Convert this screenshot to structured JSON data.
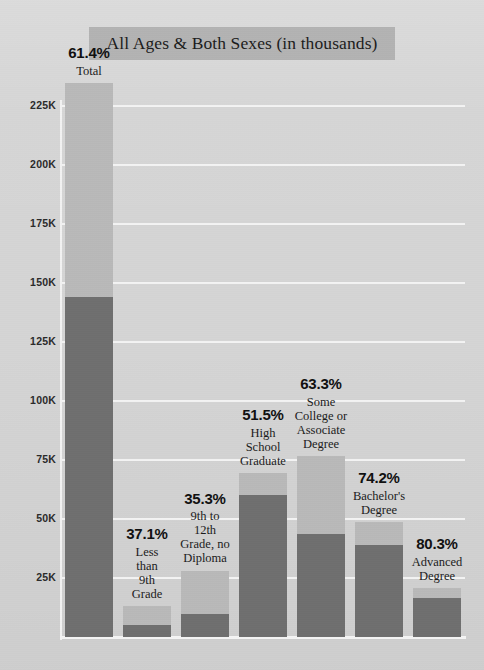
{
  "chart_data": {
    "type": "bar",
    "title": "All Ages & Both Sexes (in thousands)",
    "xlabel": "",
    "ylabel": "",
    "ylim": [
      0,
      237
    ],
    "y_unit": "thousands",
    "grid": true,
    "legend": "none",
    "stacked": true,
    "y_ticks": [
      {
        "value": 225,
        "label": "225K"
      },
      {
        "value": 200,
        "label": "200K"
      },
      {
        "value": 175,
        "label": "175K"
      },
      {
        "value": 150,
        "label": "150K"
      },
      {
        "value": 125,
        "label": "125K"
      },
      {
        "value": 100,
        "label": "100K"
      },
      {
        "value": 75,
        "label": "75K"
      },
      {
        "value": 50,
        "label": "50K"
      },
      {
        "value": 25,
        "label": "25K"
      }
    ],
    "categories": [
      "Total",
      "Less than 9th Grade",
      "9th to 12th Grade, no Diploma",
      "High School Graduate",
      "Some College or Associate Degree",
      "Bachelor's Degree",
      "Advanced Degree"
    ],
    "series": [
      {
        "name": "value",
        "values": [
          144.1,
          4.9,
          9.9,
          60.2,
          43.6,
          38.9,
          16.6
        ]
      },
      {
        "name": "total",
        "values": [
          234.7,
          13.2,
          28.1,
          69.3,
          76.5,
          48.8,
          20.6
        ]
      }
    ],
    "bars": [
      {
        "pct": "61.4%",
        "name": "Total",
        "name_lines": [
          "Total"
        ],
        "dark_value": 144.1,
        "total_value": 234.7
      },
      {
        "pct": "37.1%",
        "name": "Less than 9th Grade",
        "name_lines": [
          "Less",
          "than",
          "9th",
          "Grade"
        ],
        "dark_value": 4.9,
        "total_value": 13.2
      },
      {
        "pct": "35.3%",
        "name": "9th to 12th Grade, no Diploma",
        "name_lines": [
          "9th to",
          "12th",
          "Grade, no",
          "Diploma"
        ],
        "dark_value": 9.9,
        "total_value": 28.1
      },
      {
        "pct": "51.5%",
        "name": "High School Graduate",
        "name_lines": [
          "High",
          "School",
          "Graduate"
        ],
        "dark_value": 60.2,
        "total_value": 69.3
      },
      {
        "pct": "63.3%",
        "name": "Some College or Associate Degree",
        "name_lines": [
          "Some",
          "College or",
          "Associate",
          "Degree"
        ],
        "dark_value": 43.6,
        "total_value": 76.5
      },
      {
        "pct": "74.2%",
        "name": "Bachelor's Degree",
        "name_lines": [
          "Bachelor's",
          "Degree"
        ],
        "dark_value": 38.9,
        "total_value": 48.8
      },
      {
        "pct": "80.3%",
        "name": "Advanced Degree",
        "name_lines": [
          "Advanced",
          "Degree"
        ],
        "dark_value": 16.6,
        "total_value": 20.6
      }
    ],
    "colors": {
      "background": "#d5d5d5",
      "title_band": "#b3b3b3",
      "bar_light": "#b9b9b9",
      "bar_dark": "#6f6f6f",
      "gridline": "#f3f3f3",
      "text": "#151515"
    }
  }
}
